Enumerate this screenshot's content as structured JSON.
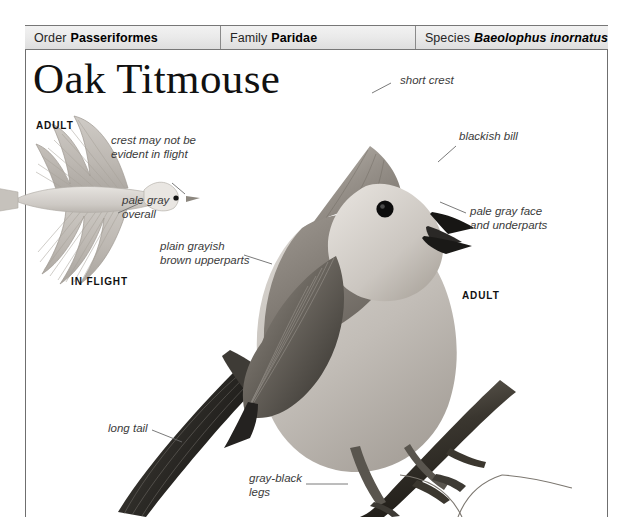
{
  "page": {
    "title": "Oak Titmouse"
  },
  "taxonomy": [
    {
      "label": "Order",
      "value": "Passeriformes",
      "italic": false
    },
    {
      "label": "Family",
      "value": "Paridae",
      "italic": false
    },
    {
      "label": "Species",
      "value": "Baeolophus inornatus",
      "italic": true
    }
  ],
  "plate_labels": [
    {
      "text": "ADULT",
      "name": "plate-label-adult-flight"
    },
    {
      "text": "IN FLIGHT",
      "name": "plate-label-in-flight"
    },
    {
      "text": "ADULT",
      "name": "plate-label-adult-perched"
    }
  ],
  "annotations": [
    {
      "name": "annotation-crest-in-flight",
      "text": "crest may not be\nevident in flight"
    },
    {
      "name": "annotation-pale-gray-overall",
      "text": "pale gray\noverall"
    },
    {
      "name": "annotation-upperparts",
      "text": "plain grayish\nbrown upperparts"
    },
    {
      "name": "annotation-long-tail",
      "text": "long tail"
    },
    {
      "name": "annotation-legs",
      "text": "gray-black\nlegs"
    },
    {
      "name": "annotation-short-crest",
      "text": "short crest"
    },
    {
      "name": "annotation-blackish-bill",
      "text": "blackish bill"
    },
    {
      "name": "annotation-pale-gray-face",
      "text": "pale gray face\nand underparts"
    }
  ],
  "colors": {
    "frame": "#6f6f6f",
    "header_text": "#1b1b1b",
    "annotation_text": "#3b3b3b",
    "leader_line": "#6b6b6b",
    "bird_body": "#9a958f",
    "bird_dark": "#4a4843",
    "branch": "#2b2a27"
  }
}
